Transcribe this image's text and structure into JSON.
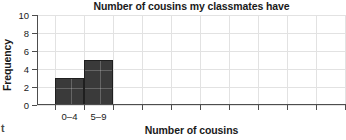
{
  "chart_data": {
    "type": "bar",
    "title": "Number of cousins my classmates have",
    "xlabel": "Number of cousins",
    "ylabel": "Frequency",
    "categories": [
      "0–4",
      "5–9"
    ],
    "values": [
      3,
      5
    ],
    "ylim": [
      0,
      10
    ],
    "yticks": [
      0,
      2,
      4,
      6,
      8,
      10
    ],
    "ytick_labels": [
      "0",
      "2",
      "4",
      "6",
      "8",
      "10"
    ],
    "xtick_labels": [
      "0–4",
      "5–9"
    ],
    "unlabeled_xticks": 8,
    "grid": true,
    "legend": "none",
    "bar_color": "#3a3a3a",
    "bar_edge_color": "#1f1f1f",
    "grid_color": "#e2e2e2",
    "axis_color": "#4d4d4d"
  },
  "artifact": {
    "glyph": "t"
  }
}
